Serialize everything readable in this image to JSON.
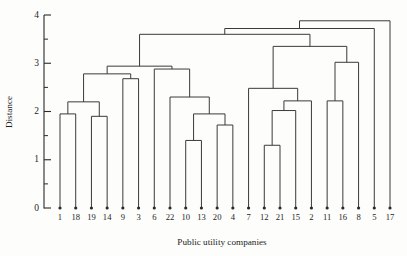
{
  "figure": {
    "background_color": "#fdfdfc",
    "ink_color": "#2a2a2a"
  },
  "axis_titles": {
    "x": "Public utility companies",
    "y": "Distance"
  },
  "chart_data": {
    "type": "line",
    "subtype": "dendrogram",
    "title": "",
    "xlabel": "Public utility companies",
    "ylabel": "Distance",
    "ylim": [
      0,
      4.15
    ],
    "grid": false,
    "legend": "none",
    "y_ticks_major": [
      0,
      1,
      2,
      3,
      4
    ],
    "y_tick_labels": [
      "0",
      "1",
      "2",
      "3",
      "4"
    ],
    "y_ticks_minor": [
      0.5,
      1.5,
      2.5,
      3.5
    ],
    "leaf_order": [
      "1",
      "18",
      "19",
      "14",
      "9",
      "3",
      "6",
      "22",
      "10",
      "13",
      "20",
      "4",
      "7",
      "12",
      "21",
      "15",
      "2",
      "11",
      "16",
      "8",
      "5",
      "17"
    ],
    "leaf_count": 22,
    "merges": [
      {
        "id": "m1",
        "left": "1",
        "right": "18",
        "height": 1.95
      },
      {
        "id": "m2",
        "left": "19",
        "right": "14",
        "height": 1.9
      },
      {
        "id": "m3",
        "left": "m1",
        "right": "m2",
        "height": 2.2
      },
      {
        "id": "m4",
        "left": "9",
        "right": "3",
        "height": 2.68
      },
      {
        "id": "m5",
        "left": "m3",
        "right": "m4",
        "height": 2.78
      },
      {
        "id": "m6",
        "left": "10",
        "right": "13",
        "height": 1.4
      },
      {
        "id": "m7",
        "left": "20",
        "right": "4",
        "height": 1.72
      },
      {
        "id": "m8",
        "left": "m6",
        "right": "m7",
        "height": 1.95
      },
      {
        "id": "m9",
        "left": "22",
        "right": "m8",
        "height": 2.3
      },
      {
        "id": "m10",
        "left": "6",
        "right": "m9",
        "height": 2.88
      },
      {
        "id": "m11",
        "left": "m5",
        "right": "m10",
        "height": 2.94
      },
      {
        "id": "m12",
        "left": "12",
        "right": "21",
        "height": 1.3
      },
      {
        "id": "m13",
        "left": "m12",
        "right": "15",
        "height": 2.02
      },
      {
        "id": "m14",
        "left": "m13",
        "right": "2",
        "height": 2.22
      },
      {
        "id": "m15",
        "left": "7",
        "right": "m14",
        "height": 2.48
      },
      {
        "id": "m16",
        "left": "11",
        "right": "16",
        "height": 2.22
      },
      {
        "id": "m17",
        "left": "m16",
        "right": "8",
        "height": 3.02
      },
      {
        "id": "m18",
        "left": "m15",
        "right": "m17",
        "height": 3.35
      },
      {
        "id": "m19",
        "left": "m11",
        "right": "m18",
        "height": 3.6
      },
      {
        "id": "m20",
        "left": "m19",
        "right": "5",
        "height": 3.72
      },
      {
        "id": "m21",
        "left": "m20",
        "right": "17",
        "height": 3.88
      }
    ],
    "note": "Hierarchical clustering dendrogram of 22 public utility companies; vertical axis is linkage distance."
  }
}
